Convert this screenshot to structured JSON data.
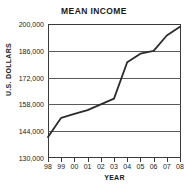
{
  "chart_data": {
    "type": "line",
    "title": "MEAN INCOME",
    "xlabel": "YEAR",
    "ylabel": "U.S. DOLLARS",
    "categories": [
      "98",
      "99",
      "00",
      "01",
      "02",
      "03",
      "04",
      "05",
      "06",
      "07",
      "08"
    ],
    "values": [
      141000,
      151000,
      153000,
      155000,
      158000,
      161000,
      180000,
      184500,
      186000,
      194000,
      198500
    ],
    "ylim": [
      130000,
      200000
    ],
    "ytick_values": [
      200000,
      186000,
      172000,
      158000,
      144000,
      130000
    ],
    "ytick_labels": [
      "200,000",
      "186,000",
      "172,000",
      "158,000",
      "144,000",
      "130,000"
    ],
    "ytick_step": 14000,
    "grid": true,
    "legend": "none",
    "series_color": "#2b2b2b",
    "grid_color": "#5a5a5a",
    "frame_color": "#3a3a3a"
  }
}
